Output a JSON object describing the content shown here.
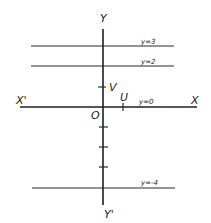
{
  "diagram": {
    "axes": {
      "x_pos_label": "X",
      "x_neg_label": "X'",
      "y_pos_label": "Y",
      "y_neg_label": "Y'",
      "origin_label": "O"
    },
    "unit_points": {
      "x_unit_label": "U",
      "y_unit_label": "V"
    },
    "horizontal_lines": [
      {
        "label": "y=3",
        "value": 3
      },
      {
        "label": "y=2",
        "value": 2
      },
      {
        "label": "y=0",
        "value": 0
      },
      {
        "label": "y=-4",
        "value": -4
      }
    ],
    "y_ticks_negative": [
      -1,
      -2,
      -3
    ],
    "colors": {
      "ink": "#222222",
      "background": "#ffffff"
    }
  }
}
